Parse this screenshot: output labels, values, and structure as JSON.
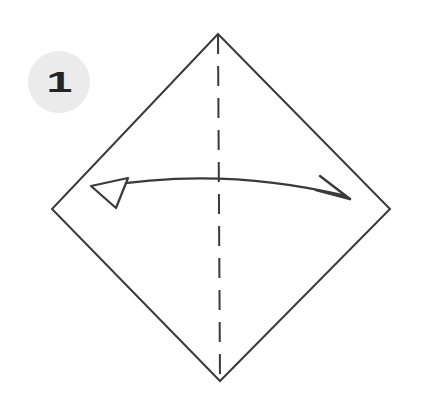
{
  "figure": {
    "kind": "origami-step-diagram",
    "width": 424,
    "height": 401,
    "background_color": "#ffffff"
  },
  "step_badge": {
    "number": "1",
    "circle_color": "#ebebeb",
    "number_color": "#242424",
    "center_x": 59,
    "center_y": 82,
    "radius": 31
  },
  "paper": {
    "shape": "square-rotated-45",
    "label": "square sheet shown as a diamond",
    "stroke_color": "#3a3a3a",
    "fill_color": "#ffffff",
    "stroke_width": 2,
    "vertices": {
      "top": [
        218,
        34
      ],
      "right": [
        390,
        209
      ],
      "bottom": [
        220,
        381
      ],
      "left": [
        52,
        209
      ]
    },
    "points_path": "218,34 390,209 220,381 52,209"
  },
  "fold_line": {
    "style": "dashed",
    "meaning": "valley fold / mirror axis",
    "color": "#3a3a3a",
    "stroke_width": 2,
    "dash_length": 20,
    "gap_length": 12,
    "from": [
      218,
      34
    ],
    "to": [
      220,
      381
    ]
  },
  "fold_arrow": {
    "style": "double-headed curved arrow",
    "meaning": "fold in half left-to-right along the dashed axis",
    "color": "#3a3a3a",
    "stroke_width": 2.4,
    "arc_path": "M 99 187 Q 222 166 346 196",
    "left_head": {
      "type": "hollow-triangle",
      "fill": "#ffffff",
      "stroke": "#3a3a3a",
      "points": "91,186 128,178 116,208"
    },
    "right_head": {
      "type": "open-v-strokes",
      "stroke": "#3a3a3a",
      "tip": [
        350,
        199
      ],
      "upper_tail": [
        320,
        176
      ],
      "lower_tail": [
        316,
        190
      ]
    }
  }
}
